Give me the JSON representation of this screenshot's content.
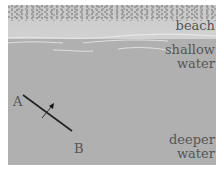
{
  "diagram": {
    "title": "",
    "regions": [
      {
        "id": "beach",
        "label": "beach"
      },
      {
        "id": "shallow",
        "label_line1": "shallow",
        "label_line2": "water"
      },
      {
        "id": "deeper",
        "label_line1": "deeper",
        "label_line2": "water"
      }
    ],
    "points": {
      "a": "A",
      "b": "B"
    },
    "colors": {
      "beach": "#cccccc",
      "water": "#b0b0b0",
      "wave": "#e6e6e6",
      "line": "#222222",
      "text": "#555555"
    }
  }
}
